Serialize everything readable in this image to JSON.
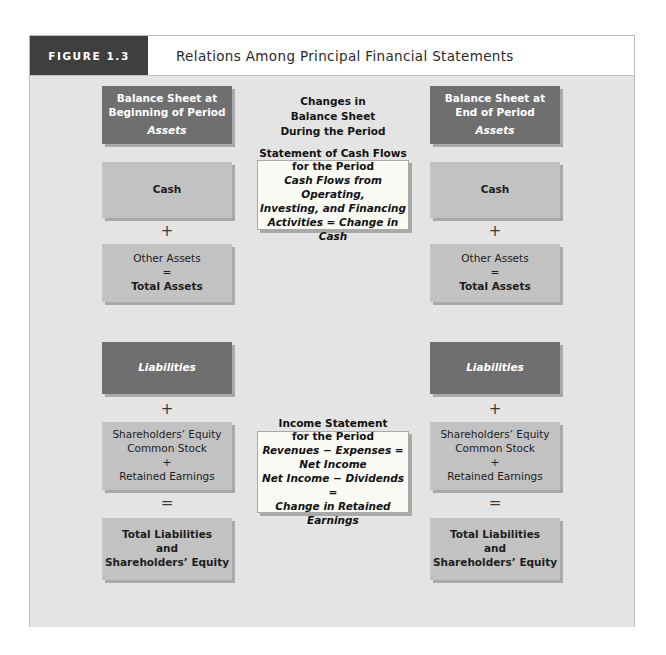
{
  "figure": {
    "tab_label": "FIGURE 1.3",
    "title": "Relations Among Principal Financial Statements"
  },
  "colors": {
    "frame_bg": "#e4e4e4",
    "dark_box": "#6f6f6f",
    "light_box": "#c2c2c2",
    "white_box": "#fbfbf6",
    "tab_bg": "#3f3f3f",
    "text_dark": "#1d1d1d",
    "text_light": "#ffffff"
  },
  "center": {
    "heading": {
      "line1": "Changes in",
      "line2": "Balance Sheet",
      "line3": "During the Period"
    },
    "cash_flows_statement": {
      "title1": "Statement of Cash Flows",
      "title2": "for the Period",
      "body1": "Cash Flows from Operating,",
      "body2": "Investing, and Financing",
      "body3": "Activities = Change in Cash"
    },
    "income_statement": {
      "title1": "Income Statement",
      "title2": "for the Period",
      "body1": "Revenues − Expenses =",
      "body2": "Net Income",
      "body3": "Net Income − Dividends =",
      "body4": "Change in Retained Earnings"
    }
  },
  "left_column": {
    "header_box": {
      "line1": "Balance Sheet at",
      "line2": "Beginning of Period",
      "line3": "Assets"
    },
    "cash_box": {
      "label": "Cash"
    },
    "operator_plus_assets": "+",
    "assets_box": {
      "line1": "Other Assets",
      "line2": "=",
      "line3": "Total Assets"
    },
    "liabilities_box": {
      "label": "Liabilities"
    },
    "operator_plus_equity": "+",
    "equity_box": {
      "line1": "Shareholders’ Equity",
      "line2": "Common Stock",
      "line3": "+",
      "line4": "Retained Earnings"
    },
    "operator_equals": "=",
    "total_box": {
      "line1": "Total Liabilities",
      "line2": "and",
      "line3": "Shareholders’ Equity"
    }
  },
  "right_column": {
    "header_box": {
      "line1": "Balance Sheet at",
      "line2": "End of Period",
      "line3": "Assets"
    },
    "cash_box": {
      "label": "Cash"
    },
    "operator_plus_assets": "+",
    "assets_box": {
      "line1": "Other Assets",
      "line2": "=",
      "line3": "Total Assets"
    },
    "liabilities_box": {
      "label": "Liabilities"
    },
    "operator_plus_equity": "+",
    "equity_box": {
      "line1": "Shareholders’ Equity",
      "line2": "Common Stock",
      "line3": "+",
      "line4": "Retained Earnings"
    },
    "operator_equals": "=",
    "total_box": {
      "line1": "Total Liabilities",
      "line2": "and",
      "line3": "Shareholders’ Equity"
    }
  }
}
